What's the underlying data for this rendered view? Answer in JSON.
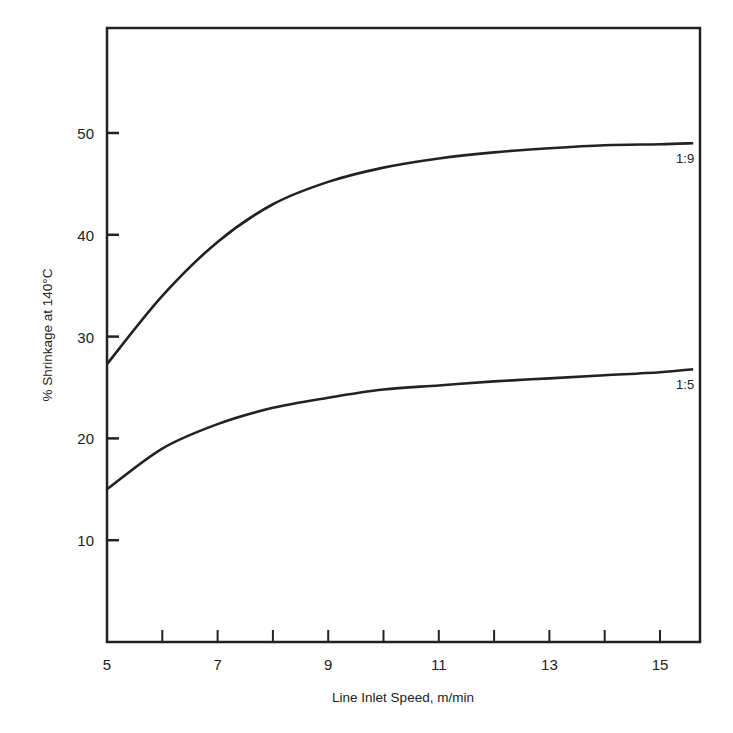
{
  "chart_data": {
    "type": "line",
    "title": "",
    "xlabel": "Line Inlet Speed, m/min",
    "ylabel": "% Shrinkage at 140°C",
    "xlim": [
      5,
      15.8
    ],
    "ylim": [
      0,
      60
    ],
    "x_ticks_major": [
      5,
      7,
      9,
      11,
      13,
      15
    ],
    "x_ticks_minor": [
      6,
      8,
      10,
      12,
      14
    ],
    "y_ticks": [
      10,
      20,
      30,
      40,
      50
    ],
    "grid": false,
    "legend": "inline labels at right end of curves",
    "x": [
      5,
      6,
      7,
      8,
      9,
      10,
      11,
      12,
      13,
      14,
      15,
      15.6
    ],
    "series": [
      {
        "name": "1:9",
        "values": [
          27.3,
          34.0,
          39.3,
          43.0,
          45.2,
          46.6,
          47.5,
          48.1,
          48.5,
          48.8,
          48.9,
          49.0
        ]
      },
      {
        "name": "1:5",
        "values": [
          15.0,
          19.0,
          21.4,
          23.0,
          24.0,
          24.8,
          25.2,
          25.6,
          25.9,
          26.2,
          26.5,
          26.8
        ]
      }
    ]
  }
}
